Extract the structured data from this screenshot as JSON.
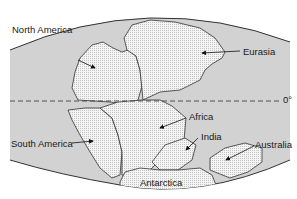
{
  "map": {
    "title": "Pangaea breakup continental positions",
    "colors": {
      "ocean": "#d2d2d2",
      "land": "#f3f3f3",
      "outline": "#333333",
      "equator": "#444444"
    },
    "equator_label": "0°",
    "labels": [
      {
        "id": "north-america",
        "text": "North America"
      },
      {
        "id": "eurasia",
        "text": "Eurasia"
      },
      {
        "id": "africa",
        "text": "Africa"
      },
      {
        "id": "south-america",
        "text": "South America"
      },
      {
        "id": "india",
        "text": "India"
      },
      {
        "id": "australia",
        "text": "Australia"
      },
      {
        "id": "antarctica",
        "text": "Antarctica"
      }
    ]
  }
}
